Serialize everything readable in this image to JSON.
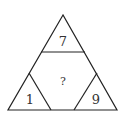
{
  "diagram": {
    "type": "number-triangle-puzzle",
    "stroke_color": "#222222",
    "background": "#ffffff",
    "regions": {
      "top": {
        "label": "7"
      },
      "center": {
        "label": "?"
      },
      "bottom_left": {
        "label": "1"
      },
      "bottom_right": {
        "label": "9"
      }
    }
  }
}
